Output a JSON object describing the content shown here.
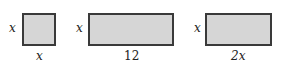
{
  "figures": [
    {
      "shape": "square",
      "side_label": "x",
      "bottom_label": "x"
    },
    {
      "shape": "rectangle",
      "side_label": "x",
      "bottom_label": "12"
    },
    {
      "shape": "rectangle",
      "side_label": "x",
      "bottom_label": "2x"
    }
  ],
  "colors": {
    "fill": "#d6d6d6",
    "border": "#3a3a3a",
    "text": "#222222"
  }
}
